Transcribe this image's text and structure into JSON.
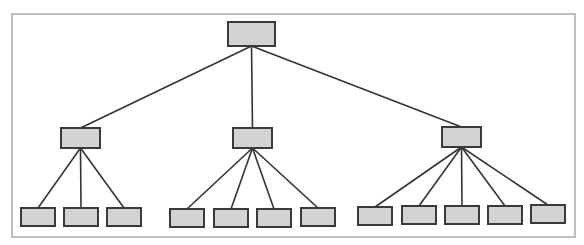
{
  "diagram": {
    "type": "tree",
    "title": "",
    "colors": {
      "frame": "#a8a8a8",
      "node_fill": "#d3d3d3",
      "node_stroke": "#3a3a3a",
      "edge": "#333333",
      "background": "#ffffff"
    },
    "frame": {
      "x": 12,
      "y": 14,
      "w": 563,
      "h": 223
    },
    "root": {
      "id": "root",
      "x": 228,
      "y": 22,
      "w": 47,
      "h": 24,
      "label": ""
    },
    "level2": [
      {
        "id": "b1",
        "x": 61,
        "y": 128,
        "w": 39,
        "h": 20,
        "label": ""
      },
      {
        "id": "b2",
        "x": 233,
        "y": 128,
        "w": 39,
        "h": 20,
        "label": ""
      },
      {
        "id": "b3",
        "x": 442,
        "y": 127,
        "w": 39,
        "h": 20,
        "label": ""
      }
    ],
    "leaves": [
      {
        "parent": "b1",
        "x": 21,
        "y": 208,
        "w": 34,
        "h": 18,
        "label": ""
      },
      {
        "parent": "b1",
        "x": 64,
        "y": 208,
        "w": 34,
        "h": 18,
        "label": ""
      },
      {
        "parent": "b1",
        "x": 107,
        "y": 208,
        "w": 34,
        "h": 18,
        "label": ""
      },
      {
        "parent": "b2",
        "x": 170,
        "y": 209,
        "w": 34,
        "h": 18,
        "label": ""
      },
      {
        "parent": "b2",
        "x": 214,
        "y": 209,
        "w": 34,
        "h": 18,
        "label": ""
      },
      {
        "parent": "b2",
        "x": 257,
        "y": 209,
        "w": 34,
        "h": 18,
        "label": ""
      },
      {
        "parent": "b2",
        "x": 301,
        "y": 208,
        "w": 34,
        "h": 18,
        "label": ""
      },
      {
        "parent": "b3",
        "x": 358,
        "y": 207,
        "w": 34,
        "h": 18,
        "label": ""
      },
      {
        "parent": "b3",
        "x": 402,
        "y": 206,
        "w": 34,
        "h": 18,
        "label": ""
      },
      {
        "parent": "b3",
        "x": 445,
        "y": 206,
        "w": 34,
        "h": 18,
        "label": ""
      },
      {
        "parent": "b3",
        "x": 488,
        "y": 206,
        "w": 34,
        "h": 18,
        "label": ""
      },
      {
        "parent": "b3",
        "x": 531,
        "y": 205,
        "w": 34,
        "h": 18,
        "label": ""
      }
    ]
  }
}
